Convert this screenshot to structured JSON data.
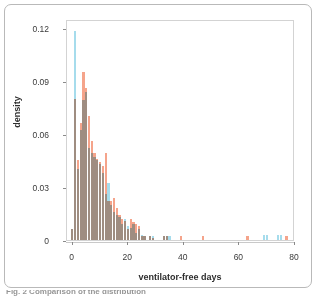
{
  "figure": {
    "caption_fragment": "Fig. 2 Comparison of the distribution"
  },
  "chart_data": {
    "type": "bar",
    "subtype": "overlapping-histogram",
    "title": "",
    "xlabel": "ventilator-free days",
    "ylabel": "density",
    "xlim": [
      -2,
      80
    ],
    "ylim": [
      0,
      0.125
    ],
    "xticks": [
      0,
      20,
      40,
      60,
      80
    ],
    "xtick_labels": [
      "0",
      "20",
      "40",
      "60",
      "80"
    ],
    "yticks": [
      0,
      0.03,
      0.06,
      0.09,
      0.12
    ],
    "ytick_labels": [
      "0",
      "0.03",
      "0.06",
      "0.09",
      "0.12"
    ],
    "grid": false,
    "legend_position": "none",
    "bin_width": 1,
    "colors": {
      "series_blue": "#A6DCEC",
      "series_salmon": "#F5A48B",
      "axis_text": "#3a3a3a",
      "panel_border": "#d3d3d3",
      "frame_border": "#b9b9b9"
    },
    "series": [
      {
        "name": "blue",
        "color": "#A6DCEC",
        "x": [
          0,
          1,
          2,
          3,
          4,
          5,
          6,
          7,
          8,
          9,
          10,
          11,
          12,
          13,
          14,
          15,
          16,
          17,
          18,
          19,
          20,
          21,
          22,
          23,
          24,
          25,
          26,
          28,
          29,
          33,
          34,
          35,
          63,
          69,
          70,
          74,
          75,
          77
        ],
        "values": [
          0.006,
          0.118,
          0.04,
          0.062,
          0.079,
          0.084,
          0.052,
          0.049,
          0.047,
          0.045,
          0.043,
          0.038,
          0.026,
          0.032,
          0.02,
          0.016,
          0.014,
          0.013,
          0.009,
          0.012,
          0.008,
          0.007,
          0.009,
          0.004,
          0.006,
          0.003,
          0.002,
          0.002,
          0.002,
          0.002,
          0.002,
          0.002,
          0.0,
          0.003,
          0.003,
          0.003,
          0.003,
          0.0
        ]
      },
      {
        "name": "salmon",
        "color": "#F5A48B",
        "x": [
          0,
          1,
          2,
          3,
          4,
          5,
          6,
          7,
          8,
          9,
          10,
          11,
          12,
          13,
          14,
          15,
          16,
          17,
          18,
          19,
          20,
          21,
          22,
          23,
          24,
          25,
          26,
          28,
          29,
          33,
          34,
          39,
          47,
          63,
          77
        ],
        "values": [
          0.006,
          0.08,
          0.045,
          0.066,
          0.095,
          0.086,
          0.07,
          0.056,
          0.049,
          0.046,
          0.044,
          0.042,
          0.049,
          0.022,
          0.022,
          0.024,
          0.018,
          0.014,
          0.012,
          0.011,
          0.006,
          0.012,
          0.01,
          0.009,
          0.008,
          0.002,
          0.002,
          0.002,
          0.001,
          0.002,
          0.002,
          0.002,
          0.002,
          0.002,
          0.002
        ]
      }
    ]
  }
}
